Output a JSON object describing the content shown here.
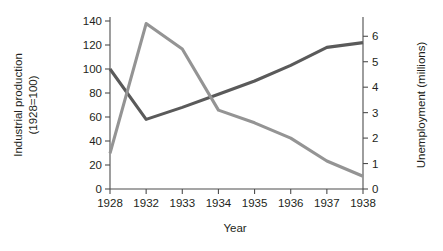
{
  "chart_data": {
    "type": "line",
    "title": "",
    "subtitle": "",
    "xlabel": "Year",
    "categories": [
      "1928",
      "1932",
      "1933",
      "1934",
      "1935",
      "1936",
      "1937",
      "1938"
    ],
    "grid": false,
    "legend": "none",
    "axes": {
      "left": {
        "label_line1": "Industrial production",
        "label_line2": "(1928=100)",
        "ticks": [
          "0",
          "20",
          "40",
          "60",
          "80",
          "100",
          "120",
          "140"
        ],
        "tick_values": [
          0,
          20,
          40,
          60,
          80,
          100,
          120,
          140
        ],
        "range": [
          0,
          140
        ]
      },
      "right": {
        "label": "Unemployment (millions)",
        "ticks": [
          "0",
          "1",
          "2",
          "3",
          "4",
          "5",
          "6"
        ],
        "tick_values": [
          0,
          1,
          2,
          3,
          4,
          5,
          6
        ],
        "range": [
          0,
          6.6
        ]
      },
      "x": {
        "label": "Year"
      }
    },
    "series": [
      {
        "name": "Industrial production",
        "axis": "left",
        "color": "#5a5a5a",
        "values": [
          100,
          58,
          68,
          79,
          90,
          103,
          118,
          122
        ]
      },
      {
        "name": "Unemployment",
        "axis": "right",
        "color": "#949494",
        "values": [
          1.4,
          6.5,
          5.5,
          3.1,
          2.6,
          2.0,
          1.1,
          0.5
        ]
      }
    ]
  }
}
